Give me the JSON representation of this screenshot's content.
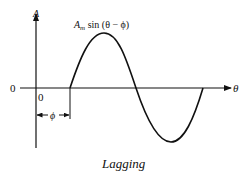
{
  "diagram": {
    "y_axis_label": "A",
    "x_axis_label": "θ",
    "origin_y_label": "0",
    "origin_x_label": "0",
    "curve_label": "A",
    "curve_label_sub": "m",
    "curve_label_rest": " sin (θ − ϕ)",
    "phase_label": "ϕ",
    "caption": "Lagging",
    "line_color": "#111111"
  }
}
